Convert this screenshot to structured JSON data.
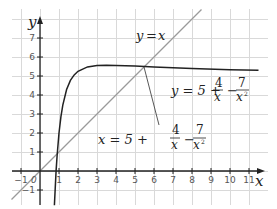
{
  "chart_data": {
    "type": "line",
    "title": "",
    "xlabel": "x",
    "ylabel": "y",
    "xlim": [
      -1.5,
      11.5
    ],
    "ylim": [
      -1.8,
      8.2
    ],
    "grid": true,
    "x_ticks": [
      "-1",
      "0",
      "1",
      "2",
      "3",
      "4",
      "5",
      "6",
      "7",
      "8",
      "9",
      "10",
      "11"
    ],
    "y_ticks": [
      "-1",
      "1",
      "2",
      "3",
      "4",
      "5",
      "6",
      "7"
    ],
    "series": [
      {
        "name": "y = x",
        "color": "#9a9a9a",
        "x": [
          -1.5,
          8.5
        ],
        "y": [
          -1.5,
          8.5
        ]
      },
      {
        "name": "y = 5 + 4/x - 7/x^2",
        "color": "#222222",
        "x": [
          0.758,
          0.8,
          0.85,
          0.9,
          1.0,
          1.1,
          1.2,
          1.4,
          1.6,
          1.8,
          2.0,
          2.5,
          3.0,
          3.5,
          4.0,
          5.0,
          6.0,
          8.0,
          10.0,
          11.5
        ],
        "y": [
          -1.8,
          -0.94,
          0.02,
          0.8,
          2.0,
          2.85,
          3.47,
          4.29,
          4.77,
          5.06,
          5.25,
          5.48,
          5.56,
          5.57,
          5.56,
          5.52,
          5.47,
          5.39,
          5.33,
          5.3
        ]
      }
    ],
    "annotations": [
      {
        "text": "y = x",
        "at": [
          4.5,
          7.2
        ]
      },
      {
        "text": "y = 5 + 4/x - 7/x²",
        "at": [
          8.5,
          4.3
        ]
      },
      {
        "text": "x = 5 + 4/x - 7/x²",
        "at": [
          4.5,
          2.3
        ],
        "pointer_to": [
          5.5,
          5.5
        ]
      }
    ]
  },
  "labels": {
    "x_axis": "x",
    "y_axis": "y",
    "origin": "0",
    "eq1_lhs": "y",
    "eq1_eq": "=",
    "eq1_rhs": "x",
    "eq2_lhs": "y = 5 +",
    "eq3_lhs": "x = 5 +",
    "frac1_num": "4",
    "frac1_den": "x",
    "minus": "−",
    "frac2_num": "7",
    "frac2_den": "x",
    "frac2_exp": "2"
  }
}
